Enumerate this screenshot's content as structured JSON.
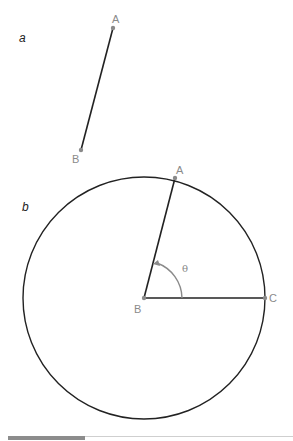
{
  "panels": {
    "a": {
      "label": "a",
      "points": {
        "A": {
          "label": "A",
          "x": 113,
          "y": 28
        },
        "B": {
          "label": "B",
          "x": 81,
          "y": 150
        }
      }
    },
    "b": {
      "label": "b",
      "circle": {
        "cx": 144,
        "cy": 298,
        "r": 121
      },
      "points": {
        "A": {
          "label": "A",
          "x": 175,
          "y": 178
        },
        "B": {
          "label": "B",
          "x": 144,
          "y": 298
        },
        "C": {
          "label": "C",
          "x": 265,
          "y": 298
        }
      },
      "angle_label": "θ"
    }
  },
  "colors": {
    "line": "#222222",
    "point": "#8a8a8a",
    "arrow": "#8a8a8a"
  }
}
